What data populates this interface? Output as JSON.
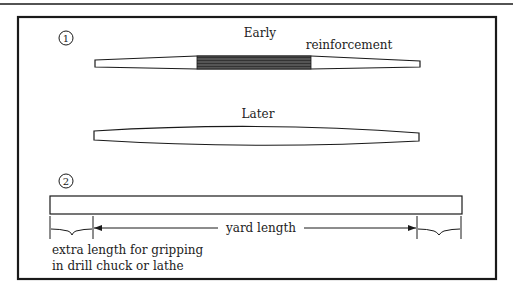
{
  "figure": {
    "section1": {
      "number": "1",
      "early_label": "Early",
      "reinforcement_label": "reinforcement",
      "later_label": "Later"
    },
    "section2": {
      "number": "2",
      "yard_label": "yard length",
      "extra_line1": "extra length for gripping",
      "extra_line2": "in drill chuck or lathe"
    }
  },
  "colors": {
    "line": "#1a1a1a",
    "reinforcement": "#4a4a4a",
    "background": "#ffffff"
  }
}
